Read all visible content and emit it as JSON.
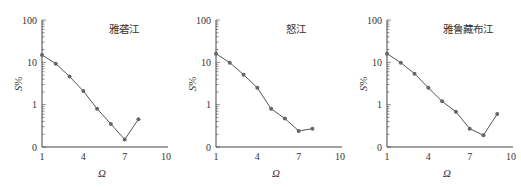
{
  "chart_data": [
    {
      "type": "line",
      "title": "雅砻江",
      "xlabel": "Ω",
      "ylabel": "S%",
      "yscale": "log",
      "xlim": [
        1,
        10
      ],
      "ylim": [
        0.1,
        100
      ],
      "xticks": [
        "1",
        "4",
        "7",
        "10"
      ],
      "yticks": [
        "0",
        "1",
        "10",
        "100"
      ],
      "grid": false,
      "series": [
        {
          "name": "雅砻江",
          "x": [
            1,
            2,
            3,
            4,
            5,
            6,
            7,
            8
          ],
          "values": [
            15,
            9.3,
            4.6,
            2.1,
            0.8,
            0.35,
            0.15,
            0.45
          ]
        }
      ]
    },
    {
      "type": "line",
      "title": "怒江",
      "xlabel": "Ω",
      "ylabel": "S%",
      "yscale": "log",
      "xlim": [
        1,
        10
      ],
      "ylim": [
        0.1,
        100
      ],
      "xticks": [
        "1",
        "4",
        "7",
        "10"
      ],
      "yticks": [
        "0",
        "1",
        "10",
        "100"
      ],
      "grid": false,
      "series": [
        {
          "name": "怒江",
          "x": [
            1,
            2,
            3,
            4,
            5,
            6,
            7,
            8
          ],
          "values": [
            16,
            9.8,
            5.1,
            2.5,
            0.8,
            0.47,
            0.24,
            0.27
          ]
        }
      ]
    },
    {
      "type": "line",
      "title": "雅鲁藏布江",
      "xlabel": "Ω",
      "ylabel": "S%",
      "yscale": "log",
      "xlim": [
        1,
        10
      ],
      "ylim": [
        0.1,
        100
      ],
      "xticks": [
        "1",
        "4",
        "7",
        "10"
      ],
      "yticks": [
        "0",
        "1",
        "10",
        "100"
      ],
      "grid": false,
      "series": [
        {
          "name": "雅鲁藏布江",
          "x": [
            1,
            2,
            3,
            4,
            5,
            6,
            7,
            8,
            9
          ],
          "values": [
            16,
            9.8,
            5.4,
            2.5,
            1.2,
            0.68,
            0.27,
            0.19,
            0.6
          ]
        }
      ]
    }
  ],
  "panels": [
    {
      "title": "雅砻江",
      "xlabel": "Ω",
      "ylabel_main": "S",
      "ylabel_unit": "%"
    },
    {
      "title": "怒江",
      "xlabel": "Ω",
      "ylabel_main": "S",
      "ylabel_unit": "%"
    },
    {
      "title": "雅鲁藏布江",
      "xlabel": "Ω",
      "ylabel_main": "S",
      "ylabel_unit": "%"
    }
  ],
  "style": {
    "line_color": "#555555",
    "marker_color": "#666666",
    "axis_color": "#444444"
  }
}
